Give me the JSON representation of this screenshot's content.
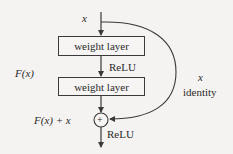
{
  "diagram": {
    "input_label": "x",
    "function_label": "F(x)",
    "layers": [
      {
        "label": "weight layer"
      },
      {
        "label": "weight layer"
      }
    ],
    "activation_between": "ReLU",
    "sum_label": "F(x) + x",
    "sum_symbol": "+",
    "activation_after": "ReLU",
    "shortcut": {
      "var_label": "x",
      "type_label": "identity"
    }
  },
  "colors": {
    "background": "#f4f3f1",
    "stroke": "#3a3a3a",
    "text": "#2a2a2a"
  }
}
